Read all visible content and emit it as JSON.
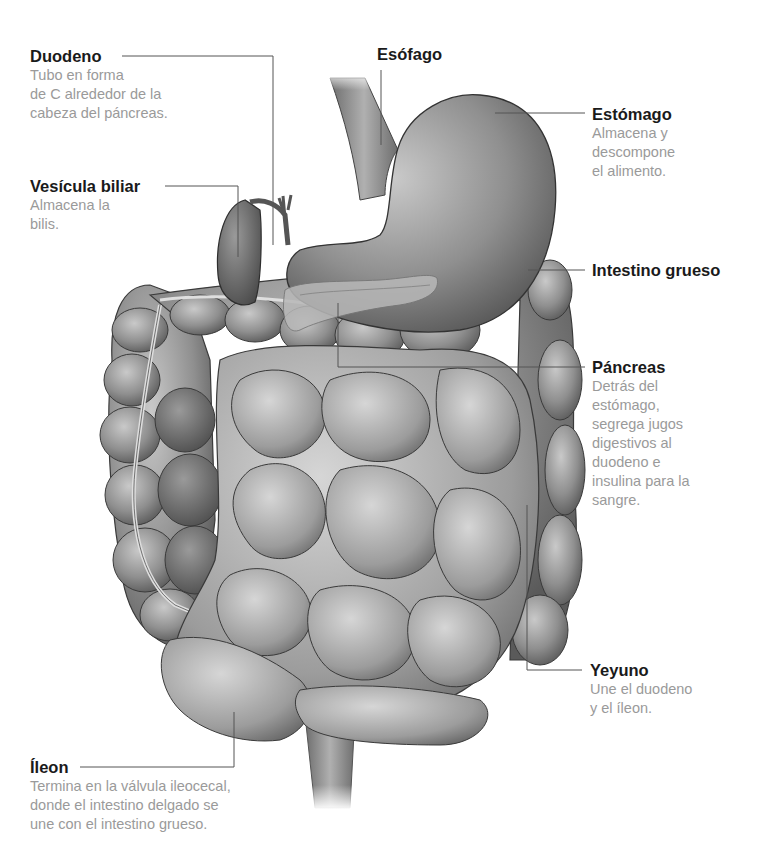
{
  "diagram": {
    "colors": {
      "title_text": "#1a1a1a",
      "description_text": "#9a9a9a",
      "leader_line": "#555555",
      "organ_gray": "#8a8a8a"
    }
  },
  "labels": {
    "duodeno": {
      "title": "Duodeno",
      "description": "Tubo en forma\nde C alrededor de la\ncabeza del páncreas."
    },
    "vesicula": {
      "title": "Vesícula biliar",
      "description": "Almacena la\nbilis."
    },
    "esofago": {
      "title": "Esófago",
      "description": ""
    },
    "estomago": {
      "title": "Estómago",
      "description": "Almacena y\ndescompone\nel alimento."
    },
    "intestino_grueso": {
      "title": "Intestino grueso",
      "description": ""
    },
    "pancreas": {
      "title": "Páncreas",
      "description": "Detrás del\nestómago,\nsegrega jugos\ndigestivos al\nduodeno e\ninsulina para la\nsangre."
    },
    "yeyuno": {
      "title": "Yeyuno",
      "description": "Une el duodeno\ny el íleon."
    },
    "ileon": {
      "title": "Íleon",
      "description": "Termina en la válvula ileocecal,\ndonde el intestino delgado se\nune con el intestino grueso."
    }
  }
}
